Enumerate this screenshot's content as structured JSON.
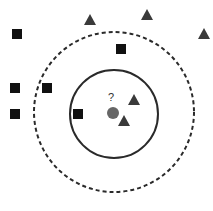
{
  "diagram": {
    "type": "knn-classification",
    "query_label": "?",
    "colors": {
      "square": "#111111",
      "triangle": "#3a3a3a",
      "query": "#666666",
      "solid_circle": "#2a2a2a",
      "dashed_circle": "#2a2a2a"
    },
    "query_point": {
      "x": 113,
      "y": 113
    },
    "inner_circle": {
      "cx": 114,
      "cy": 114,
      "r": 44,
      "style": "solid"
    },
    "outer_circle": {
      "cx": 114,
      "cy": 112,
      "r": 80,
      "style": "dashed"
    },
    "squares": [
      {
        "x": 17,
        "y": 34
      },
      {
        "x": 121,
        "y": 49
      },
      {
        "x": 15,
        "y": 88
      },
      {
        "x": 47,
        "y": 88
      },
      {
        "x": 15,
        "y": 114
      },
      {
        "x": 78,
        "y": 114
      }
    ],
    "triangles": [
      {
        "x": 90,
        "y": 20
      },
      {
        "x": 147,
        "y": 15
      },
      {
        "x": 204,
        "y": 34
      },
      {
        "x": 134,
        "y": 100
      },
      {
        "x": 124,
        "y": 121
      }
    ]
  }
}
